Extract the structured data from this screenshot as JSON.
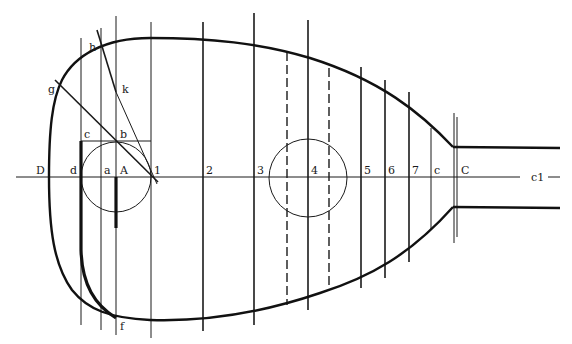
{
  "diagram": {
    "title": "",
    "type": "geometric construction of lute body outline",
    "labels": {
      "D": "D",
      "d": "d",
      "a": "a",
      "A": "A",
      "one": "1",
      "two": "2",
      "three": "3",
      "four": "4",
      "five": "5",
      "six": "6",
      "seven": "7",
      "c_lower": "c",
      "C": "C",
      "centerline": "c1",
      "c_top": "c",
      "b": "b",
      "g": "g",
      "h": "h",
      "k": "k",
      "f": "f"
    },
    "colors": {
      "ink": "#1a1a1a",
      "paper": "#ffffff"
    }
  }
}
